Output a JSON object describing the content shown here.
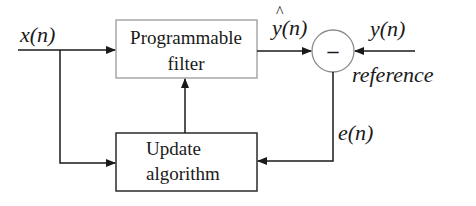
{
  "diagram": {
    "type": "adaptive-filter-block-diagram",
    "blocks": {
      "programmable_filter": {
        "line1": "Programmable",
        "line2": "filter"
      },
      "update_algorithm": {
        "line1": "Update",
        "line2": "algorithm"
      },
      "summing_junction": {
        "symbol": "–"
      }
    },
    "signals": {
      "input": "x(n)",
      "output_estimate": "y(n)",
      "output_estimate_hat": "^",
      "desired": "y(n)",
      "desired_caption": "reference",
      "error": "e(n)"
    },
    "colors": {
      "line": "#1a1a1a",
      "filter_border": "#9a9a9a",
      "update_border": "#2a2a2a",
      "background": "#ffffff"
    }
  }
}
